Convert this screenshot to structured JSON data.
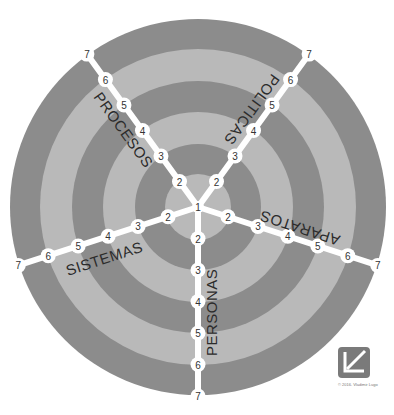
{
  "diagram": {
    "center": {
      "x": 198,
      "y": 207
    },
    "ring_step": 31.5,
    "colors": {
      "dark": "#8c8c8c",
      "light": "#b9b9b9",
      "spoke": "#ffffff",
      "text": "#2b2b2b"
    },
    "center_node_label": "1",
    "axes": [
      {
        "name": "PERSONAS",
        "angle_deg": 90,
        "levels": [
          "2",
          "3",
          "4",
          "5",
          "6",
          "7"
        ]
      },
      {
        "name": "SISTEMAS",
        "angle_deg": 162,
        "levels": [
          "2",
          "3",
          "4",
          "5",
          "6",
          "7"
        ]
      },
      {
        "name": "PROCESOS",
        "angle_deg": 234,
        "levels": [
          "2",
          "3",
          "4",
          "5",
          "6",
          "7"
        ]
      },
      {
        "name": "POLITICAS",
        "angle_deg": 306,
        "levels": [
          "2",
          "3",
          "4",
          "5",
          "6",
          "7"
        ]
      },
      {
        "name": "APARATOS",
        "angle_deg": 18,
        "levels": [
          "2",
          "3",
          "4",
          "5",
          "6",
          "7"
        ]
      }
    ]
  },
  "labels": {
    "personas": "PERSONAS",
    "sistemas": "SISTEMAS",
    "procesos": "PROCESOS",
    "politicas": "POLITICAS",
    "aparatos": "APARATOS"
  },
  "logo": {
    "name": "VL-logo",
    "copyright": "© 2016. Vladimir Lugo"
  }
}
